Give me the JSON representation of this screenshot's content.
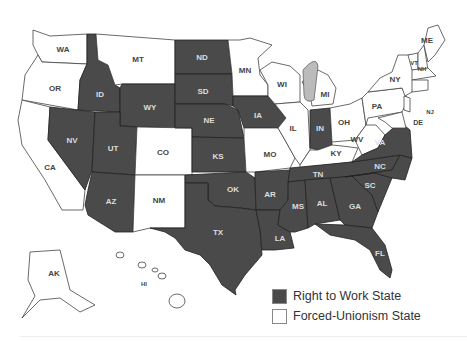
{
  "legend": {
    "items": [
      {
        "label": "Right to Work State",
        "color": "#4a4a4a"
      },
      {
        "label": "Forced-Unionism State",
        "color": "#ffffff"
      }
    ]
  },
  "states": {
    "WA": "WA",
    "OR": "OR",
    "CA": "CA",
    "ID": "ID",
    "NV": "NV",
    "MT": "MT",
    "WY": "WY",
    "UT": "UT",
    "AZ": "AZ",
    "CO": "CO",
    "NM": "NM",
    "ND": "ND",
    "SD": "SD",
    "NE": "NE",
    "KS": "KS",
    "OK": "OK",
    "TX": "TX",
    "MN": "MN",
    "IA": "IA",
    "MO": "MO",
    "AR": "AR",
    "LA": "LA",
    "WI": "WI",
    "IL": "IL",
    "MI": "MI",
    "IN": "IN",
    "OH": "OH",
    "KY": "KY",
    "TN": "TN",
    "MS": "MS",
    "AL": "AL",
    "GA": "GA",
    "FL": "FL",
    "SC": "SC",
    "NC": "NC",
    "VA": "VA",
    "WV": "WV",
    "PA": "PA",
    "NY": "NY",
    "VT": "VT",
    "NH": "NH",
    "ME": "ME",
    "MA": "MA",
    "NJ": "NJ",
    "DE": "DE",
    "AK": "AK",
    "HI": "HI"
  },
  "right_to_work": [
    "ID",
    "NV",
    "UT",
    "AZ",
    "WY",
    "ND",
    "SD",
    "NE",
    "KS",
    "OK",
    "TX",
    "IA",
    "AR",
    "LA",
    "MS",
    "AL",
    "GA",
    "FL",
    "SC",
    "NC",
    "VA",
    "TN",
    "IN"
  ],
  "forced_unionism": [
    "WA",
    "OR",
    "CA",
    "MT",
    "CO",
    "NM",
    "MN",
    "MO",
    "WI",
    "IL",
    "MI",
    "OH",
    "KY",
    "WV",
    "PA",
    "NY",
    "VT",
    "NH",
    "ME",
    "MA",
    "NJ",
    "DE",
    "AK",
    "HI"
  ]
}
